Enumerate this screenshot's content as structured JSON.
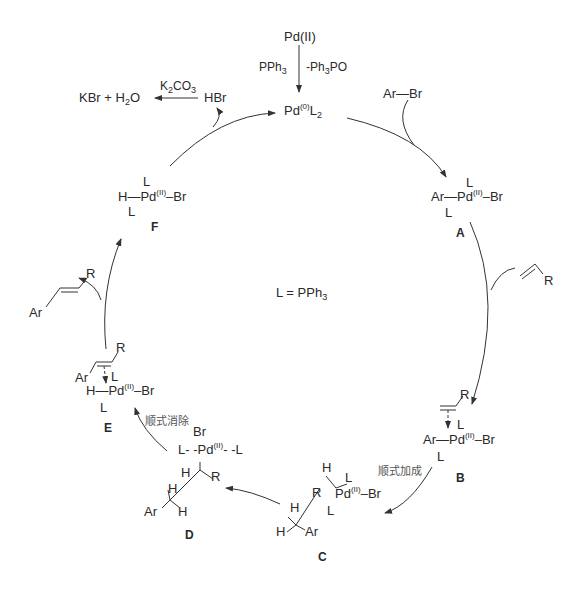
{
  "diagram": {
    "type": "catalytic-cycle",
    "legend": "L = PPh3",
    "precatalyst": {
      "label": "Pd(II)",
      "reagent_left": "PPh3",
      "reagent_right": "-Ph3PO"
    },
    "catalyst": "Pd(0)L2",
    "inputs": {
      "aryl_halide": "Ar—Br",
      "alkene": "R"
    },
    "outputs": {
      "hbr": "HBr",
      "base": "K2CO3",
      "salts": "KBr + H2O",
      "product_ar": "Ar",
      "product_r": "R"
    },
    "steps": {
      "syn_addition": "顺式加成",
      "syn_elimination": "顺式消除"
    },
    "intermediates": [
      {
        "id": "A",
        "name": "Ar-Pd(II)(L)2-Br"
      },
      {
        "id": "B",
        "name": "alkene π-complex Ar-Pd(II)(L)2-Br"
      },
      {
        "id": "C",
        "name": "syn-insertion intermediate"
      },
      {
        "id": "D",
        "name": "alkyl-Pd(II)(L)2Br"
      },
      {
        "id": "E",
        "name": "H-Pd(II)(L)2-Br alkene complex"
      },
      {
        "id": "F",
        "name": "H-Pd(II)(L)2-Br"
      }
    ],
    "atoms": {
      "L": "L",
      "Ar": "Ar",
      "Br": "Br",
      "H": "H",
      "Pd": "Pd",
      "R": "R",
      "ox2": "(II)",
      "ox0": "(0)"
    }
  }
}
